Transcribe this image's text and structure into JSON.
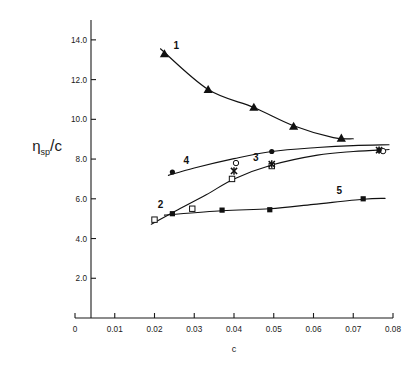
{
  "chart_data": {
    "type": "scatter",
    "title": "",
    "xlabel": "c",
    "ylabel": "ηsp/c",
    "ylabel_parts": {
      "eta": "η",
      "subscript": "sp",
      "slash": "/",
      "denominator": "c"
    },
    "xlim": [
      0,
      0.08
    ],
    "ylim": [
      0,
      15.0
    ],
    "xticks": [
      0,
      0.01,
      0.02,
      0.03,
      0.04,
      0.05,
      0.06,
      0.07,
      0.08
    ],
    "xtick_labels": [
      "0",
      "0.01",
      "0.02",
      "0.03",
      "0.04",
      "0.05",
      "0.06",
      "0.07",
      "0.08"
    ],
    "yticks": [
      2.0,
      4.0,
      6.0,
      8.0,
      10.0,
      12.0,
      14.0
    ],
    "ytick_labels": [
      "2.0",
      "4.0",
      "6.0",
      "8.0",
      "10.0",
      "12.0",
      "14.0"
    ],
    "grid": false,
    "legend": "inline-numeric-labels",
    "series": [
      {
        "name": "1",
        "label": "1",
        "marker": "filled-triangle",
        "color": "#111111",
        "x": [
          0.0225,
          0.0335,
          0.045,
          0.055,
          0.067
        ],
        "y": [
          13.3,
          11.5,
          10.6,
          9.65,
          9.05
        ]
      },
      {
        "name": "2",
        "label": "2",
        "marker": "open-square",
        "color": "#111111",
        "x": [
          0.02,
          0.0295,
          0.0395,
          0.0495
        ],
        "y": [
          4.95,
          5.5,
          7.0,
          7.65
        ]
      },
      {
        "name": "3",
        "label": "3",
        "marker": "cross",
        "color": "#111111",
        "x": [
          0.04,
          0.0495,
          0.0765
        ],
        "y": [
          7.4,
          7.75,
          8.45
        ]
      },
      {
        "name": "3-open-circles",
        "label": "3",
        "marker": "open-circle",
        "color": "#111111",
        "x": [
          0.0405,
          0.0775
        ],
        "y": [
          7.8,
          8.4
        ]
      },
      {
        "name": "4",
        "label": "4",
        "marker": "filled-circle",
        "color": "#111111",
        "x": [
          0.0245,
          0.0495,
          0.0765
        ],
        "y": [
          7.35,
          8.38,
          8.45
        ]
      },
      {
        "name": "5",
        "label": "5",
        "marker": "filled-square",
        "color": "#111111",
        "x": [
          0.0245,
          0.037,
          0.049,
          0.0725
        ],
        "y": [
          5.25,
          5.43,
          5.45,
          6.0
        ]
      }
    ],
    "series_labels": [
      {
        "text": "1",
        "x": 0.0255,
        "y": 13.55
      },
      {
        "text": "2",
        "x": 0.0215,
        "y": 5.55
      },
      {
        "text": "3",
        "x": 0.0455,
        "y": 7.9
      },
      {
        "text": "4",
        "x": 0.028,
        "y": 7.75
      },
      {
        "text": "5",
        "x": 0.0665,
        "y": 6.25
      }
    ]
  }
}
